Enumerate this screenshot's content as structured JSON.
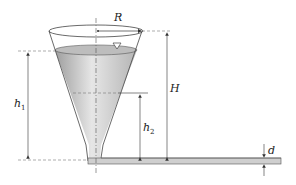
{
  "diagram": {
    "type": "conical tank draining through horizontal pipe",
    "labels": {
      "R": "R",
      "H": "H",
      "h1_main": "h",
      "h1_sub": "1",
      "h2_main": "h",
      "h2_sub": "2",
      "d": "d"
    },
    "symbols": {
      "free_surface": "inverted-triangle"
    },
    "colors": {
      "line": "#333333",
      "dashed": "#777777",
      "liquid_light": "#e8e8e8",
      "liquid_dark": "#a8a8a8",
      "pipe": "#c8c8c8"
    }
  }
}
